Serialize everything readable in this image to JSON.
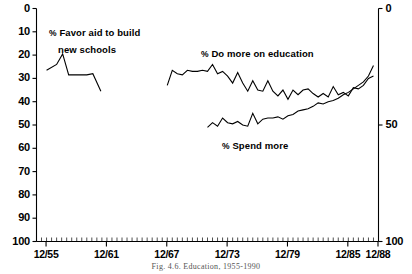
{
  "figure": {
    "caption": "Fig. 4.6.  Education, 1955-1990"
  },
  "axes": {
    "y_left_ticks": [
      "100",
      "90",
      "80",
      "70",
      "60",
      "50",
      "40",
      "30",
      "20",
      "10",
      "0"
    ],
    "y_right_ticks": [
      "100",
      "50",
      "0"
    ],
    "x_ticks": [
      "12/55",
      "12/61",
      "12/67",
      "12/73",
      "12/79",
      "12/85",
      "12/88"
    ]
  },
  "annotations": {
    "series1_line1": "% Favor aid to build",
    "series1_line2": "new schools",
    "series2": "% Do more on education",
    "series3": "% Spend more"
  },
  "chart_data": {
    "type": "line",
    "title": "Fig. 4.6.  Education, 1955-1990",
    "xlabel": "",
    "ylabel": "",
    "ylim": [
      0,
      100
    ],
    "xlim": [
      1955.0,
      1989.0
    ],
    "grid": false,
    "legend": "inline-annotations",
    "y_left_ticks": [
      0,
      10,
      20,
      30,
      40,
      50,
      60,
      70,
      80,
      90,
      100
    ],
    "y_right_ticks": [
      0,
      50,
      100
    ],
    "x_tick_labels": [
      "12/55",
      "12/61",
      "12/67",
      "12/73",
      "12/79",
      "12/85",
      "12/88"
    ],
    "x_tick_values": [
      1955.95,
      1961.95,
      1967.95,
      1973.95,
      1979.95,
      1985.95,
      1988.95
    ],
    "series": [
      {
        "name": "% Favor aid to build new schools",
        "x": [
          1956.0,
          1957.0,
          1957.6,
          1958.2,
          1959.0,
          1960.0,
          1960.6,
          1961.4
        ],
        "values": [
          73.5,
          76.0,
          80.5,
          71.5,
          71.5,
          71.5,
          72.0,
          64.5
        ]
      },
      {
        "name": "% Do more on education",
        "x": [
          1968.0,
          1968.5,
          1969.0,
          1969.5,
          1970.0,
          1970.5,
          1971.0,
          1971.5,
          1972.0,
          1972.5,
          1973.0,
          1973.5,
          1974.0,
          1974.5,
          1975.0,
          1975.5,
          1976.0,
          1976.5,
          1977.0,
          1977.5,
          1978.0,
          1978.5,
          1979.0,
          1979.5,
          1980.0,
          1980.5,
          1981.0,
          1981.5,
          1982.0,
          1982.5,
          1983.0,
          1983.5,
          1984.0,
          1984.5,
          1985.0,
          1985.5,
          1986.0,
          1986.5,
          1987.0,
          1987.5,
          1988.0,
          1988.5
        ],
        "values": [
          67.0,
          73.5,
          72.0,
          71.5,
          73.5,
          73.0,
          73.0,
          73.5,
          73.0,
          76.0,
          72.0,
          73.0,
          71.0,
          68.0,
          72.5,
          68.0,
          64.5,
          69.0,
          65.0,
          64.5,
          69.0,
          64.5,
          62.5,
          65.0,
          61.0,
          65.0,
          63.0,
          65.0,
          65.5,
          63.5,
          62.0,
          63.5,
          62.0,
          66.5,
          63.0,
          64.0,
          62.5,
          66.0,
          65.5,
          67.0,
          70.0,
          71.0
        ]
      },
      {
        "name": "% Spend more",
        "x": [
          1972.0,
          1972.5,
          1973.0,
          1973.5,
          1974.0,
          1974.5,
          1975.0,
          1975.5,
          1976.0,
          1976.5,
          1977.0,
          1977.5,
          1978.0,
          1978.5,
          1979.0,
          1979.5,
          1980.0,
          1980.5,
          1981.0,
          1981.5,
          1982.0,
          1982.5,
          1983.0,
          1983.5,
          1984.0,
          1984.5,
          1985.0,
          1985.5,
          1986.0,
          1986.5,
          1987.0,
          1987.5,
          1988.0,
          1988.5
        ],
        "values": [
          49.0,
          51.0,
          49.5,
          53.0,
          51.0,
          50.5,
          51.5,
          50.0,
          49.5,
          55.0,
          50.5,
          52.5,
          53.0,
          53.0,
          53.5,
          52.5,
          54.0,
          54.5,
          56.0,
          56.5,
          57.0,
          58.0,
          59.5,
          59.0,
          60.0,
          60.5,
          61.5,
          63.0,
          64.0,
          65.5,
          67.0,
          68.5,
          71.0,
          75.5
        ]
      }
    ]
  }
}
